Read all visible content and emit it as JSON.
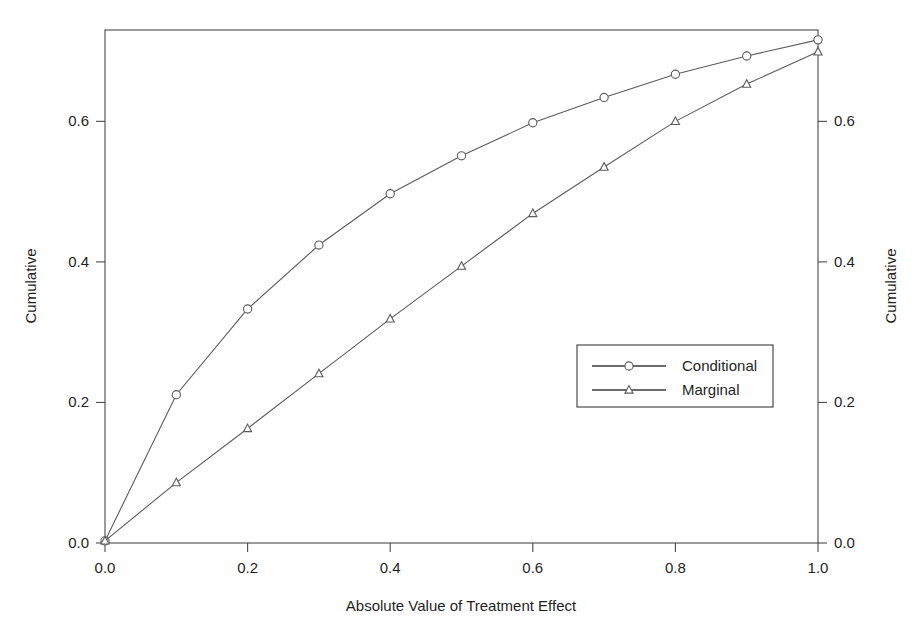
{
  "chart_data": {
    "type": "line",
    "title": "",
    "subtitle": "",
    "xlabel": "Absolute Value of Treatment Effect",
    "ylabel": "Cumulative",
    "ylabel_right": "Cumulative",
    "xlim": [
      0.0,
      1.0
    ],
    "ylim": [
      0.0,
      0.73
    ],
    "grid": false,
    "legend_position": "center-right",
    "xticks": [
      "0.0",
      "0.2",
      "0.4",
      "0.6",
      "0.8",
      "1.0"
    ],
    "xtick_values": [
      0.0,
      0.2,
      0.4,
      0.6,
      0.8,
      1.0
    ],
    "yticks": [
      "0.0",
      "0.2",
      "0.4",
      "0.6"
    ],
    "ytick_values": [
      0.0,
      0.2,
      0.4,
      0.6
    ],
    "yticks_right": [
      "0.0",
      "0.2",
      "0.4",
      "0.6"
    ],
    "x": [
      0.0,
      0.1,
      0.2,
      0.3,
      0.4,
      0.5,
      0.6,
      0.7,
      0.8,
      0.9,
      1.0
    ],
    "series": [
      {
        "name": "Conditional",
        "marker": "circle",
        "values": [
          0.003,
          0.211,
          0.333,
          0.424,
          0.497,
          0.551,
          0.598,
          0.634,
          0.667,
          0.693,
          0.716
        ]
      },
      {
        "name": "Marginal",
        "marker": "triangle",
        "values": [
          0.003,
          0.086,
          0.163,
          0.241,
          0.319,
          0.394,
          0.469,
          0.535,
          0.6,
          0.653,
          0.699
        ]
      }
    ]
  },
  "legend": {
    "entries": [
      {
        "label": "Conditional",
        "marker": "circle"
      },
      {
        "label": "Marginal",
        "marker": "triangle"
      }
    ]
  },
  "axes": {
    "x_title": "Absolute Value of Treatment Effect",
    "y_title_left": "Cumulative",
    "y_title_right": "Cumulative"
  },
  "colors": {
    "background": "#ffffff",
    "frame": "#4a4a4a",
    "series_line": "#5b5b5b",
    "marker_fill": "#ffffff",
    "text": "#1f1f1f"
  }
}
